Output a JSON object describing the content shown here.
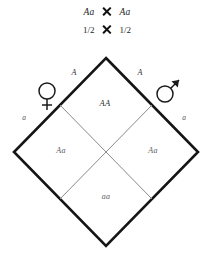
{
  "header": {
    "parent_cross": {
      "left": "Aa",
      "operator": "cross-multiplication-sign",
      "right": "Aa"
    },
    "gamete_cross": {
      "left": "1/2",
      "operator": "cross-multiplication-sign",
      "right": "1/2"
    }
  },
  "diagram": {
    "type": "punnett-square-diamond",
    "maternal_symbol": "female-venus-symbol",
    "paternal_symbol": "male-mars-symbol",
    "edge_alleles": {
      "top_left": "A",
      "top_right": "A",
      "bottom_left": "a",
      "bottom_right": "a"
    },
    "cells": {
      "top": "AA",
      "left": "Aa",
      "right": "Aa",
      "bottom": "aa"
    },
    "geometry": {
      "top_vertex": [
        106,
        58
      ],
      "left_vertex": [
        14,
        152
      ],
      "right_vertex": [
        198,
        152
      ],
      "bottom_vertex": [
        106,
        246
      ],
      "center": [
        106,
        152
      ]
    },
    "colors": {
      "outline": "#151515",
      "inner_grid": "#8a8a8a",
      "text": "#2a2a2a",
      "background": "#ffffff"
    }
  }
}
